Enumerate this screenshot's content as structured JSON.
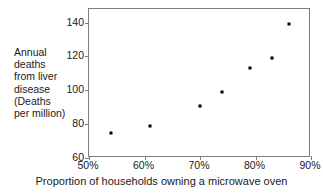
{
  "chart_data": {
    "type": "scatter",
    "title": "",
    "xlabel": "Proportion of households owning a microwave oven",
    "ylabel": "Annual deaths from liver disease (Deaths per million)",
    "ylabel_lines": [
      "Annual",
      "deaths",
      "from liver",
      "disease",
      "(Deaths",
      "per million)"
    ],
    "xlim": [
      50,
      90
    ],
    "ylim": [
      60,
      148
    ],
    "xticks": [
      50,
      60,
      70,
      80,
      90
    ],
    "yticks": [
      60,
      80,
      100,
      120,
      140
    ],
    "xtick_labels": [
      "50%",
      "60%",
      "70%",
      "80%",
      "90%"
    ],
    "ytick_labels": [
      "60",
      "80",
      "100",
      "120",
      "140"
    ],
    "grid": false,
    "legend": null,
    "point_color": "#000000",
    "axis_color": "#7d7d7d",
    "x": [
      54,
      61,
      70,
      74,
      79,
      83,
      86
    ],
    "y": [
      75,
      79,
      91,
      99,
      113,
      119,
      139
    ],
    "points": [
      {
        "x": 54,
        "y": 75
      },
      {
        "x": 61,
        "y": 79
      },
      {
        "x": 70,
        "y": 91
      },
      {
        "x": 74,
        "y": 99
      },
      {
        "x": 79,
        "y": 113
      },
      {
        "x": 83,
        "y": 119
      },
      {
        "x": 86,
        "y": 139
      }
    ]
  }
}
